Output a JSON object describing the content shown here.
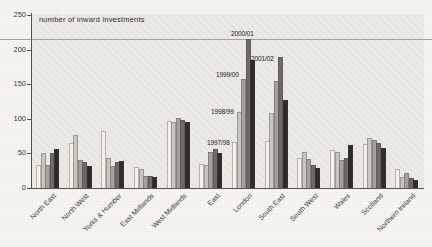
{
  "chart": {
    "inner_label": "number of inward investments",
    "paper_color": "#f7f5f0",
    "plot_color": "#eceae4",
    "axis_color": "#55534e",
    "series_annotations": [
      {
        "text": "1997/98",
        "x": 207,
        "y": 139
      },
      {
        "text": "1998/99",
        "x": 211,
        "y": 108
      },
      {
        "text": "1999/00",
        "x": 216,
        "y": 71
      },
      {
        "text": "2000/01",
        "x": 231,
        "y": 30
      },
      {
        "text": "2001/02",
        "x": 251,
        "y": 55
      }
    ]
  },
  "chart_data": {
    "type": "bar",
    "title": "number of inward investments",
    "xlabel": "",
    "ylabel": "",
    "ylim": [
      0,
      250
    ],
    "yticks": [
      0,
      50,
      100,
      150,
      200,
      250
    ],
    "grid": false,
    "legend_position": "annotations near London group",
    "categories": [
      "North East",
      "North West",
      "Yorks & Humber",
      "East Midlands",
      "West Midlands",
      "East",
      "London",
      "South East",
      "South West",
      "Wales",
      "Scotland",
      "Northern Ireland"
    ],
    "series": [
      {
        "name": "1997/98",
        "color": "#f3f1e9",
        "values": [
          33,
          65,
          82,
          30,
          97,
          34,
          66,
          68,
          43,
          55,
          64,
          28
        ]
      },
      {
        "name": "1998/99",
        "color": "#c9c6bf",
        "values": [
          50,
          77,
          43,
          28,
          95,
          33,
          110,
          108,
          52,
          52,
          72,
          16
        ]
      },
      {
        "name": "1999/00",
        "color": "#a5a29b",
        "values": [
          33,
          40,
          32,
          17,
          101,
          52,
          158,
          155,
          42,
          40,
          70,
          21
        ]
      },
      {
        "name": "2000/01",
        "color": "#6e6b66",
        "values": [
          50,
          37,
          38,
          18,
          98,
          57,
          216,
          190,
          33,
          44,
          65,
          15
        ]
      },
      {
        "name": "2001/02",
        "color": "#2d2c29",
        "values": [
          57,
          32,
          39,
          16,
          95,
          50,
          185,
          127,
          29,
          62,
          58,
          11
        ]
      }
    ]
  }
}
